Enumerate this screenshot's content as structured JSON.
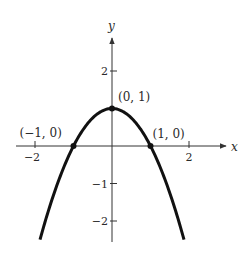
{
  "chart_data": {
    "type": "line",
    "title": "",
    "function": "y = 1 - x^2",
    "xlabel": "x",
    "ylabel": "y",
    "x_ticks": [
      {
        "value": -2,
        "label": "−2"
      },
      {
        "value": 2,
        "label": "2"
      }
    ],
    "y_ticks": [
      {
        "value": 2,
        "label": "2"
      },
      {
        "value": -1,
        "label": "−1"
      },
      {
        "value": -2,
        "label": "−2"
      }
    ],
    "xlim": [
      -2.5,
      3.0
    ],
    "ylim": [
      -2.5,
      2.8
    ],
    "grid": false,
    "legend": null,
    "curve_x_range": [
      -1.87,
      1.87
    ],
    "points": [
      {
        "x": -1,
        "y": 0,
        "label": "(−1, 0)"
      },
      {
        "x": 0,
        "y": 1,
        "label": "(0, 1)"
      },
      {
        "x": 1,
        "y": 0,
        "label": "(1, 0)"
      }
    ],
    "colors": {
      "curve": "#111111",
      "axes": "#333333",
      "text": "#2a2a2a"
    }
  }
}
